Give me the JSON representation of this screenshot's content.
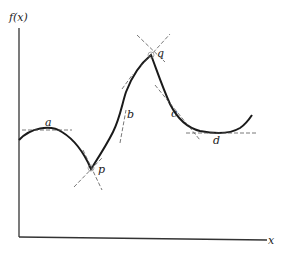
{
  "figure": {
    "axes": {
      "y_label": "f(x)",
      "x_label": "x"
    },
    "points": [
      {
        "id": "a",
        "label": "a",
        "type": "local maximum (horizontal tangent)"
      },
      {
        "id": "p",
        "label": "p",
        "type": "corner (two one-sided tangents)"
      },
      {
        "id": "b",
        "label": "b",
        "type": "inflection point (tangent crosses curve)"
      },
      {
        "id": "q",
        "label": "q",
        "type": "cusp/corner maximum (two one-sided tangents)"
      },
      {
        "id": "c",
        "label": "c",
        "type": "point with tangent on decreasing part"
      },
      {
        "id": "d",
        "label": "d",
        "type": "local minimum (horizontal tangent)"
      }
    ],
    "colors": {
      "curve": "#1a1a1a",
      "axis": "#333333",
      "tangent": "#555555"
    }
  }
}
